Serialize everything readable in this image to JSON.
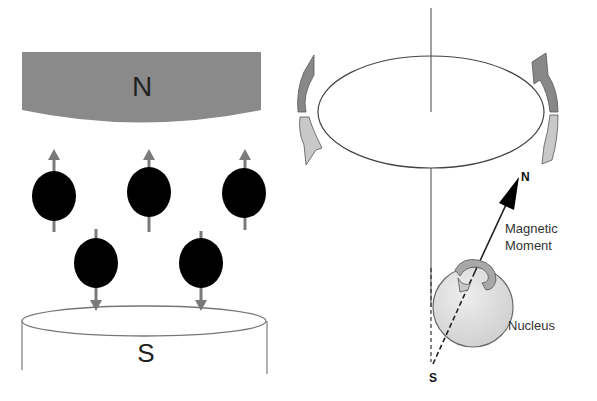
{
  "left_panel": {
    "north_label": "N",
    "south_label": "S",
    "colors": {
      "magnet_north": "#8a8a8a",
      "particle": "#000000",
      "arrow": "#7a7a7a"
    },
    "particles_up": [
      {
        "x": 54
      },
      {
        "x": 148
      },
      {
        "x": 244
      }
    ],
    "particles_down": [
      {
        "x": 96
      },
      {
        "x": 201
      }
    ]
  },
  "right_panel": {
    "axis_north_label": "N",
    "axis_south_label": "S",
    "moment_label_line1": "Magnetic",
    "moment_label_line2": "Moment",
    "nucleus_label": "Nucleus",
    "colors": {
      "nucleus_fill": "#dcdcdc",
      "arrow_dark": "#888888",
      "arrow_light": "#c8c8c8"
    }
  }
}
